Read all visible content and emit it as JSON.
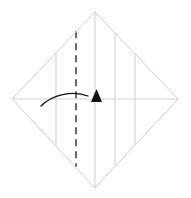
{
  "figure": {
    "kind": "origami-crease-diagram",
    "canvas": {
      "width": 191,
      "height": 198,
      "background": "#ffffff"
    },
    "colors": {
      "outline": "#cfcfcf",
      "crease_solid": "#cfcfcf",
      "crease_dashed": "#2b2b2b",
      "arrow": "#111111",
      "background": "#ffffff"
    },
    "shape": {
      "name": "square rotated 45 degrees (diamond)",
      "vertices": {
        "top": {
          "x": 95,
          "y": 12
        },
        "right": {
          "x": 178,
          "y": 99
        },
        "bottom": {
          "x": 95,
          "y": 188
        },
        "left": {
          "x": 12,
          "y": 99
        }
      },
      "outline_width": 1
    },
    "creases": {
      "horizontal": [
        {
          "name": "center-horizontal-crease",
          "style": "solid",
          "y": 99,
          "x1": 12,
          "x2": 178
        }
      ],
      "vertical_solid": [
        {
          "name": "vertical-crease-1",
          "x": 56,
          "y1": 72,
          "y2": 127
        },
        {
          "name": "vertical-crease-center",
          "x": 95,
          "y1": 12,
          "y2": 188
        },
        {
          "name": "vertical-crease-3",
          "x": 115,
          "y1": 32,
          "y2": 168
        },
        {
          "name": "vertical-crease-4",
          "x": 135,
          "y1": 52,
          "y2": 148
        }
      ],
      "vertical_dashed": [
        {
          "name": "valley-fold-line",
          "x": 76,
          "y1": 33,
          "y2": 168,
          "dash_pattern": "7 5",
          "width": 1.4
        }
      ]
    },
    "arrow": {
      "name": "fold-direction-arrow",
      "description": "curved arc sweeping left to right ending in a solid triangular arrowhead",
      "path": "M 41 106 C 52 95 72 90 88 96",
      "stroke_width": 1.3,
      "head": {
        "points": "96.5,89 102,102 91,102",
        "fill": "#111111"
      }
    },
    "labels": []
  }
}
